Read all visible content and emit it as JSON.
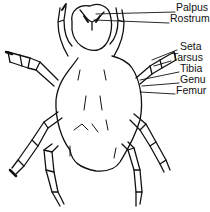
{
  "diagram": {
    "labels": [
      {
        "text": "Palpus",
        "x": 176,
        "y": 7
      },
      {
        "text": "Rostrum",
        "x": 170,
        "y": 18
      },
      {
        "text": "Seta",
        "x": 178,
        "y": 46
      },
      {
        "text": "Tarsus",
        "x": 172,
        "y": 57
      },
      {
        "text": "Tibia",
        "x": 180,
        "y": 68
      },
      {
        "text": "Genu",
        "x": 180,
        "y": 79
      },
      {
        "text": "Femur",
        "x": 176,
        "y": 90
      }
    ],
    "line_color": "#111111"
  }
}
